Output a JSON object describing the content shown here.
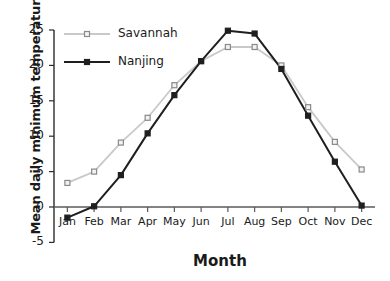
{
  "chart_data": {
    "type": "line",
    "title": "",
    "xlabel": "Month",
    "ylabel": "Mean daily minimum temperature (ºC)",
    "categories": [
      "Jan",
      "Feb",
      "Mar",
      "Apr",
      "May",
      "Jun",
      "Jul",
      "Aug",
      "Sep",
      "Oct",
      "Nov",
      "Dec"
    ],
    "yticks": [
      -5,
      0,
      5,
      10,
      15,
      20,
      25
    ],
    "ytick_labels": [
      "-5",
      "0",
      "5",
      "10",
      "15",
      "20",
      "25"
    ],
    "ylim": [
      -5,
      25
    ],
    "grid": false,
    "legend_position": "top-left inside",
    "series": [
      {
        "name": "Savannah",
        "color": "#c9c9c9",
        "marker": "open-square",
        "marker_edge_color": "#8a8a8a",
        "values": [
          3.4,
          5.0,
          9.1,
          12.6,
          17.2,
          20.6,
          22.6,
          22.6,
          20.0,
          14.1,
          9.2,
          5.3
        ]
      },
      {
        "name": "Nanjing",
        "color": "#1f1f1f",
        "marker": "filled-square",
        "marker_edge_color": "#1f1f1f",
        "values": [
          -1.5,
          0.1,
          4.5,
          10.4,
          15.8,
          20.6,
          24.9,
          24.5,
          19.5,
          12.9,
          6.4,
          0.2
        ]
      }
    ]
  },
  "legend": {
    "items": [
      {
        "label": "Savannah"
      },
      {
        "label": "Nanjing"
      }
    ]
  },
  "axes": {
    "x_title": "Month",
    "y_title": "Mean daily minimum temperature (ºC)"
  }
}
